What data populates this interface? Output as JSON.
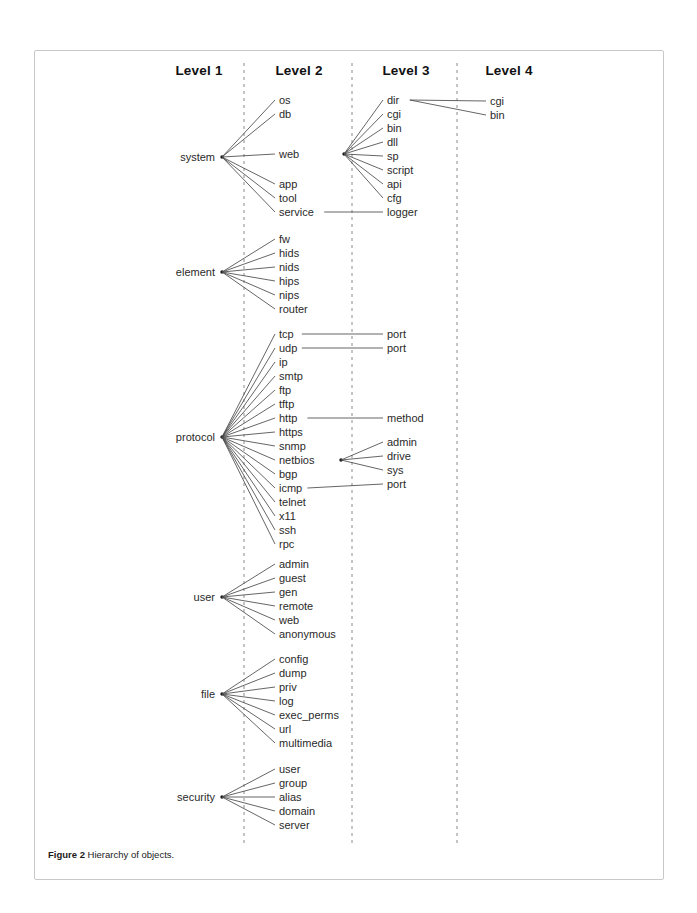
{
  "figure": {
    "caption_label": "Figure 2",
    "caption_text": "Hierarchy of objects.",
    "border_color": "#c9c9c9",
    "background": "#ffffff"
  },
  "diagram": {
    "type": "hierarchy-tree",
    "line_color": "#4a4a4a",
    "text_color": "#2a2a2a",
    "divider_color": "#8a8a8a",
    "columns": [
      {
        "id": "level1",
        "label": "Level 1",
        "center_x": 198
      },
      {
        "id": "level2",
        "label": "Level 2",
        "center_x": 298
      },
      {
        "id": "level3",
        "label": "Level 3",
        "center_x": 405
      },
      {
        "id": "level4",
        "label": "Level 4",
        "center_x": 508
      }
    ],
    "dividers_x": [
      243,
      351,
      456
    ],
    "header_y": 74,
    "label_x": {
      "level1_right": 214,
      "level2": 278,
      "level3": 386,
      "level4": 489
    },
    "hub_x": {
      "level1": 221,
      "level2": 343,
      "level3": 451
    },
    "row_step": 13.8,
    "groups": [
      {
        "id": "system",
        "root": "system",
        "root_y": 156,
        "hub_y": 156,
        "children": [
          {
            "label": "os",
            "y": 99
          },
          {
            "label": "db",
            "y": 113
          },
          {
            "label": "web",
            "y": 153,
            "hub_y": 153,
            "grandchildren": [
              {
                "label": "dir",
                "y": 99,
                "hub_y": 99,
                "greatgrandchildren": [
                  {
                    "label": "cgi",
                    "y": 100
                  },
                  {
                    "label": "bin",
                    "y": 114
                  }
                ]
              },
              {
                "label": "cgi",
                "y": 113
              },
              {
                "label": "bin",
                "y": 127
              },
              {
                "label": "dll",
                "y": 141
              },
              {
                "label": "sp",
                "y": 155
              },
              {
                "label": "script",
                "y": 169
              },
              {
                "label": "api",
                "y": 183
              },
              {
                "label": "cfg",
                "y": 197
              }
            ]
          },
          {
            "label": "app",
            "y": 183
          },
          {
            "label": "tool",
            "y": 197
          },
          {
            "label": "service",
            "y": 211,
            "hub_y": 211,
            "straight": true,
            "grandchildren": [
              {
                "label": "logger",
                "y": 211
              }
            ]
          }
        ]
      },
      {
        "id": "element",
        "root": "element",
        "root_y": 271,
        "hub_y": 271,
        "children": [
          {
            "label": "fw",
            "y": 238
          },
          {
            "label": "hids",
            "y": 252
          },
          {
            "label": "nids",
            "y": 266
          },
          {
            "label": "hips",
            "y": 280
          },
          {
            "label": "nips",
            "y": 294
          },
          {
            "label": "router",
            "y": 308
          }
        ]
      },
      {
        "id": "protocol",
        "root": "protocol",
        "root_y": 436,
        "hub_y": 436,
        "children": [
          {
            "label": "tcp",
            "y": 333,
            "hub_y": 333,
            "straight": true,
            "grandchildren": [
              {
                "label": "port",
                "y": 333
              }
            ]
          },
          {
            "label": "udp",
            "y": 347,
            "hub_y": 347,
            "straight": true,
            "grandchildren": [
              {
                "label": "port",
                "y": 347
              }
            ]
          },
          {
            "label": "ip",
            "y": 361
          },
          {
            "label": "smtp",
            "y": 375
          },
          {
            "label": "ftp",
            "y": 389
          },
          {
            "label": "tftp",
            "y": 403
          },
          {
            "label": "http",
            "y": 417,
            "hub_y": 417,
            "straight": true,
            "grandchildren": [
              {
                "label": "method",
                "y": 417
              }
            ]
          },
          {
            "label": "https",
            "y": 431
          },
          {
            "label": "snmp",
            "y": 445
          },
          {
            "label": "netbios",
            "y": 459,
            "hub_y": 459,
            "hub_x": 340,
            "grandchildren": [
              {
                "label": "admin",
                "y": 441
              },
              {
                "label": "drive",
                "y": 455
              },
              {
                "label": "sys",
                "y": 469
              }
            ]
          },
          {
            "label": "bgp",
            "y": 473
          },
          {
            "label": "icmp",
            "y": 487,
            "hub_y": 487,
            "straight": true,
            "grandchildren": [
              {
                "label": "port",
                "y": 483
              }
            ]
          },
          {
            "label": "telnet",
            "y": 501
          },
          {
            "label": "x11",
            "y": 515
          },
          {
            "label": "ssh",
            "y": 529
          },
          {
            "label": "rpc",
            "y": 543
          }
        ]
      },
      {
        "id": "user",
        "root": "user",
        "root_y": 596,
        "hub_y": 596,
        "children": [
          {
            "label": "admin",
            "y": 563
          },
          {
            "label": "guest",
            "y": 577
          },
          {
            "label": "gen",
            "y": 591
          },
          {
            "label": "remote",
            "y": 605
          },
          {
            "label": "web",
            "y": 619
          },
          {
            "label": "anonymous",
            "y": 633
          }
        ]
      },
      {
        "id": "file",
        "root": "file",
        "root_y": 693,
        "hub_y": 693,
        "children": [
          {
            "label": "config",
            "y": 658
          },
          {
            "label": "dump",
            "y": 672
          },
          {
            "label": "priv",
            "y": 686
          },
          {
            "label": "log",
            "y": 700
          },
          {
            "label": "exec_perms",
            "y": 714
          },
          {
            "label": "url",
            "y": 728
          },
          {
            "label": "multimedia",
            "y": 742
          }
        ]
      },
      {
        "id": "security",
        "root": "security",
        "root_y": 796,
        "hub_y": 796,
        "children": [
          {
            "label": "user",
            "y": 768
          },
          {
            "label": "group",
            "y": 782
          },
          {
            "label": "alias",
            "y": 796
          },
          {
            "label": "domain",
            "y": 810
          },
          {
            "label": "server",
            "y": 824
          }
        ]
      }
    ]
  }
}
